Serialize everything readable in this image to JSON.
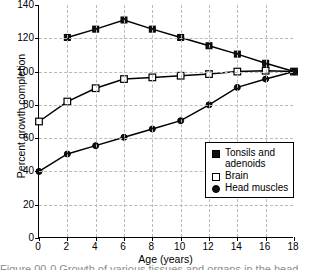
{
  "chart_data": {
    "type": "line",
    "title": "",
    "xlabel": "Age (years)",
    "ylabel": "Percent growth completion",
    "x": [
      0,
      2,
      4,
      6,
      8,
      10,
      12,
      14,
      16,
      18
    ],
    "xlim": [
      0,
      18
    ],
    "ylim": [
      0,
      140
    ],
    "xticks": [
      "0",
      "2",
      "4",
      "6",
      "8",
      "10",
      "12",
      "14",
      "16",
      "18"
    ],
    "yticks": [
      "0",
      "20",
      "40",
      "60",
      "80",
      "100",
      "120",
      "140"
    ],
    "grid": true,
    "legend_position": "lower right",
    "series": [
      {
        "name": "Tonsils and\nadenoids",
        "marker": "filled-square",
        "x": [
          2,
          4,
          6,
          8,
          10,
          12,
          14,
          16,
          18
        ],
        "values": [
          120.5,
          125.5,
          131,
          125.5,
          120.5,
          115.5,
          110.5,
          105,
          100
        ]
      },
      {
        "name": "Brain",
        "marker": "open-square",
        "x": [
          0,
          2,
          4,
          6,
          8,
          10,
          12,
          14,
          16,
          18
        ],
        "values": [
          70,
          82,
          90,
          95.5,
          96.5,
          97.5,
          98.5,
          100,
          100.5,
          100
        ]
      },
      {
        "name": "Head muscles",
        "marker": "filled-circle",
        "x": [
          0,
          2,
          4,
          6,
          8,
          10,
          12,
          14,
          16,
          18
        ],
        "values": [
          40,
          50.5,
          55.5,
          60.5,
          65.5,
          70.5,
          80,
          90.5,
          95.5,
          100
        ]
      }
    ]
  },
  "legend": {
    "items": [
      {
        "label": "Tonsils and\nadenoids",
        "marker": "filled-square"
      },
      {
        "label": "Brain",
        "marker": "open-square"
      },
      {
        "label": "Head muscles",
        "marker": "filled-circle"
      }
    ]
  },
  "caption_sliver": "Figure 00-0  Growth of various tissues and organs in the head."
}
